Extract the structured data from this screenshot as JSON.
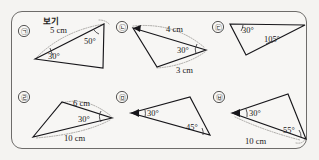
{
  "panel": {
    "legend_label": "보기",
    "border_color": "#6e6c6a",
    "background_color": "#f7f6f4"
  },
  "items": [
    {
      "id": "item-a",
      "marker": "㉠",
      "labels": [
        {
          "name": "side-length-label",
          "text": "5 cm"
        },
        {
          "name": "angle-label",
          "text": "50°"
        },
        {
          "name": "angle-label",
          "text": "30°"
        }
      ]
    },
    {
      "id": "item-b",
      "marker": "㉡",
      "labels": [
        {
          "name": "side-length-label",
          "text": "4 cm"
        },
        {
          "name": "angle-label",
          "text": "30°"
        },
        {
          "name": "side-length-label",
          "text": "3 cm"
        }
      ]
    },
    {
      "id": "item-c",
      "marker": "㉢",
      "labels": [
        {
          "name": "angle-label",
          "text": "30°"
        },
        {
          "name": "angle-label",
          "text": "105°"
        }
      ]
    },
    {
      "id": "item-d",
      "marker": "㉣",
      "labels": [
        {
          "name": "side-length-label",
          "text": "6 cm"
        },
        {
          "name": "angle-label",
          "text": "30°"
        },
        {
          "name": "side-length-label",
          "text": "10 cm"
        }
      ]
    },
    {
      "id": "item-e",
      "marker": "㉤",
      "labels": [
        {
          "name": "angle-label",
          "text": "30°"
        },
        {
          "name": "angle-label",
          "text": "45°"
        }
      ]
    },
    {
      "id": "item-f",
      "marker": "㉥",
      "labels": [
        {
          "name": "angle-label",
          "text": "30°"
        },
        {
          "name": "angle-label",
          "text": "55°"
        },
        {
          "name": "side-length-label",
          "text": "10 cm"
        }
      ]
    }
  ],
  "text": {
    "a_5cm": "5 cm",
    "a_50": "50°",
    "a_30": "30°",
    "b_4cm": "4 cm",
    "b_30": "30°",
    "b_3cm": "3 cm",
    "c_30": "30°",
    "c_105": "105°",
    "d_6cm": "6 cm",
    "d_30": "30°",
    "d_10cm": "10 cm",
    "e_30": "30°",
    "e_45": "45°",
    "f_30": "30°",
    "f_55": "55°",
    "f_10cm": "10 cm",
    "m_a": "㉠",
    "m_b": "㉡",
    "m_c": "㉢",
    "m_d": "㉣",
    "m_e": "㉤",
    "m_f": "㉥"
  }
}
